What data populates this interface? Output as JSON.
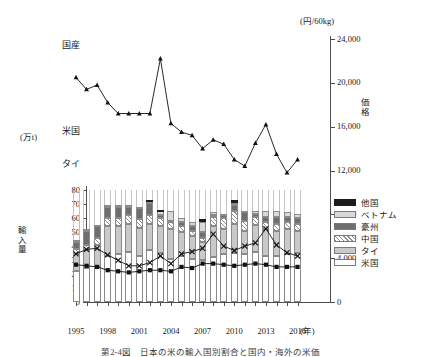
{
  "chart_data": {
    "type": "bar",
    "title": "",
    "caption": "第2-4図　日本の米の輸入国別割合と国内・海外の米価",
    "x": [
      1995,
      1996,
      1997,
      1998,
      1999,
      2000,
      2001,
      2002,
      2003,
      2004,
      2005,
      2006,
      2007,
      2008,
      2009,
      2010,
      2011,
      2012,
      2013,
      2014,
      2015,
      2016
    ],
    "xlabel": "(年)",
    "xticks": [
      1995,
      1998,
      2001,
      2004,
      2007,
      2010,
      2013,
      2016
    ],
    "left_axis": {
      "label": "輸入量",
      "unit": "(万t)",
      "ylim": [
        0,
        80
      ],
      "ticks": [
        0,
        10,
        20,
        30,
        40,
        50,
        60,
        70,
        80
      ],
      "ticklabels": [
        "0",
        "10",
        "20",
        "30",
        "40",
        "50",
        "60",
        "70",
        "80"
      ]
    },
    "right_axis": {
      "label": "価格",
      "unit": "(円/60kg)",
      "ylim": [
        0,
        24000
      ],
      "ticks": [
        0,
        4000,
        8000,
        12000,
        16000,
        20000,
        24000
      ],
      "ticklabels": [
        "0",
        "4,000",
        "8,000",
        "12,000",
        "16,000",
        "20,000",
        "24,000"
      ]
    },
    "grid": false,
    "legend_position": "right",
    "stack_order_bottom_to_top": [
      "米国",
      "タイ",
      "中国",
      "豪州",
      "ベトナム",
      "他国"
    ],
    "series": [
      {
        "name": "米国",
        "key": "us",
        "type": "bar",
        "color": "#ffffff",
        "values": [
          22,
          24,
          25,
          33,
          34,
          36,
          33,
          37,
          35,
          31,
          33,
          31,
          30,
          32,
          34,
          35,
          34,
          36,
          33,
          33,
          34,
          35
        ]
      },
      {
        "name": "タイ",
        "key": "th",
        "type": "bar",
        "color": "#c9c9c9",
        "values": [
          12,
          13,
          16,
          21,
          20,
          20,
          20,
          19,
          19,
          21,
          17,
          16,
          13,
          22,
          18,
          21,
          17,
          19,
          19,
          18,
          18,
          16
        ]
      },
      {
        "name": "中国",
        "key": "cn",
        "type": "bar",
        "color": "hatched",
        "values": [
          4,
          4,
          5,
          6,
          6,
          6,
          6,
          6,
          6,
          5,
          4,
          4,
          3,
          7,
          8,
          9,
          7,
          6,
          5,
          5,
          5,
          5
        ]
      },
      {
        "name": "豪州",
        "key": "au",
        "type": "bar",
        "color": "#6e6e6e",
        "values": [
          5,
          10,
          8,
          8,
          8,
          6,
          8,
          9,
          2,
          1,
          3,
          3,
          4,
          1,
          2,
          4,
          6,
          2,
          4,
          5,
          4,
          4
        ]
      },
      {
        "name": "ベトナム",
        "key": "vn",
        "type": "bar",
        "color": "#d9d9d9",
        "values": [
          1,
          1,
          1,
          1,
          1,
          1,
          1,
          1,
          3,
          7,
          3,
          3,
          7,
          2,
          1,
          2,
          1,
          2,
          4,
          4,
          3,
          3
        ]
      },
      {
        "name": "他国",
        "key": "ot",
        "type": "bar",
        "color": "#1c1c1c",
        "values": [
          0,
          0,
          0,
          0,
          0,
          0,
          0,
          1,
          1,
          0,
          0,
          0,
          2,
          0,
          0,
          2,
          0,
          0,
          0,
          0,
          0,
          0
        ]
      },
      {
        "name": "国産",
        "key": "domestic",
        "type": "line",
        "marker": "triangle",
        "axis": "right",
        "values": [
          20500,
          19400,
          19800,
          18200,
          17200,
          17200,
          17200,
          17200,
          22200,
          16300,
          15500,
          15200,
          14000,
          14800,
          14400,
          13000,
          12400,
          14500,
          16200,
          13500,
          11800,
          13000
        ]
      },
      {
        "name": "米国",
        "key": "us_price",
        "type": "line",
        "marker": "cross",
        "axis": "right",
        "values": [
          4400,
          4800,
          4900,
          4300,
          3800,
          3300,
          3300,
          3600,
          4200,
          3500,
          4400,
          4600,
          4900,
          6200,
          5100,
          4700,
          5100,
          5400,
          6700,
          5200,
          4500,
          4200
        ]
      },
      {
        "name": "タイ",
        "key": "th_price",
        "type": "line",
        "marker": "square",
        "axis": "right",
        "values": [
          3400,
          3300,
          3200,
          2900,
          2800,
          2700,
          2800,
          2900,
          2900,
          2800,
          3200,
          3100,
          3500,
          3500,
          3400,
          3300,
          3400,
          3500,
          3400,
          3200,
          3200,
          3200
        ]
      }
    ],
    "series_labels": {
      "domestic": "国産",
      "us_price": "米国",
      "th_price": "タイ"
    }
  },
  "legend": {
    "items": [
      {
        "label": "他国",
        "key": "ot"
      },
      {
        "label": "ベトナム",
        "key": "vn"
      },
      {
        "label": "豪州",
        "key": "au"
      },
      {
        "label": "中国",
        "key": "cn"
      },
      {
        "label": "タイ",
        "key": "th"
      },
      {
        "label": "米国",
        "key": "us"
      }
    ]
  }
}
